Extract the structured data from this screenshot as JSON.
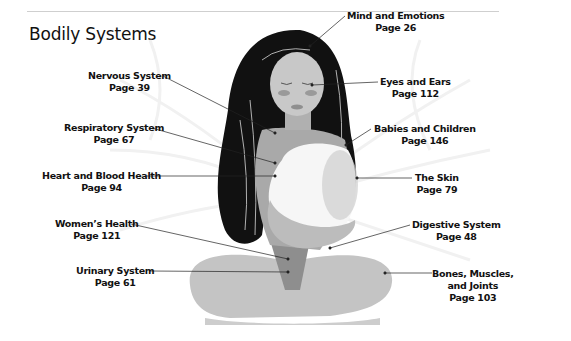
{
  "header": {
    "title": "Bodily Systems"
  },
  "labels": [
    {
      "id": "mind",
      "name": "Mind and Emotions",
      "page": "Page 26"
    },
    {
      "id": "eyes",
      "name": "Eyes and Ears",
      "page": "Page 112"
    },
    {
      "id": "babies",
      "name": "Babies and Children",
      "page": "Page 146"
    },
    {
      "id": "skin",
      "name": "The Skin",
      "page": "Page 79"
    },
    {
      "id": "digestive",
      "name": "Digestive System",
      "page": "Page 48"
    },
    {
      "id": "bones",
      "name": "Bones, Muscles,",
      "name2": "and Joints",
      "page": "Page 103"
    },
    {
      "id": "nervous",
      "name": "Nervous System",
      "page": "Page 39"
    },
    {
      "id": "respiratory",
      "name": "Respiratory System",
      "page": "Page 67"
    },
    {
      "id": "heart",
      "name": "Heart and Blood Health",
      "page": "Page 94"
    },
    {
      "id": "womens",
      "name": "Women’s Health",
      "page": "Page 121"
    },
    {
      "id": "urinary",
      "name": "Urinary System",
      "page": "Page 61"
    }
  ],
  "colors": {
    "hair": "#111111",
    "skin": "#b8b8b8",
    "body": "#a9a9a9",
    "baby": "#f4f4f4",
    "legs": "#bdbdbd",
    "dark_legs": "#8e8e8e"
  }
}
